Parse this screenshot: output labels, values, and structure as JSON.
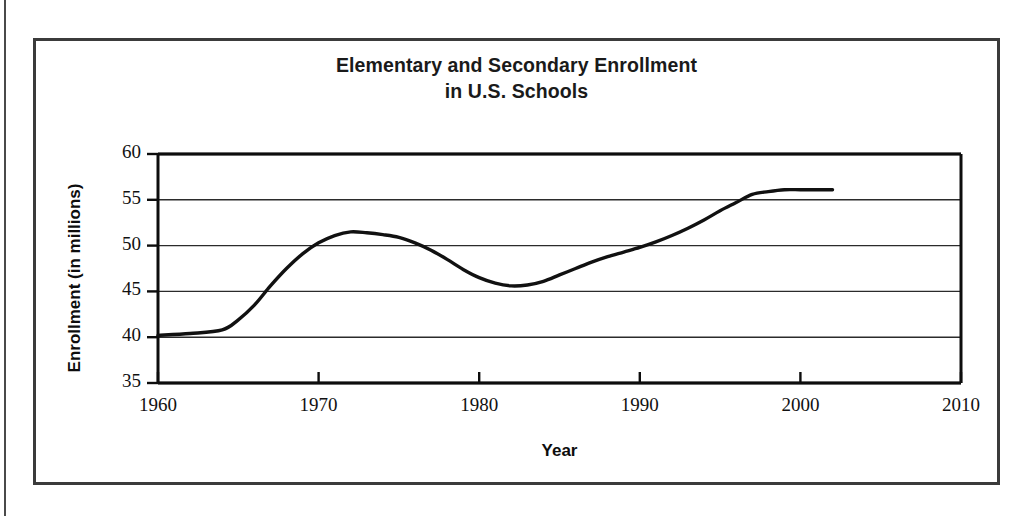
{
  "chart_data": {
    "type": "line",
    "title": "Elementary and Secondary Enrollment in U.S. Schools",
    "title_lines": [
      "Elementary and Secondary Enrollment",
      "in U.S. Schools"
    ],
    "xlabel": "Year",
    "ylabel": "Enrollment (in millions)",
    "xlim": [
      1960,
      2010
    ],
    "ylim": [
      35,
      60
    ],
    "xticks": [
      1960,
      1970,
      1980,
      1990,
      2000,
      2010
    ],
    "yticks": [
      35,
      40,
      45,
      50,
      55,
      60
    ],
    "xtick_labels": [
      "1960",
      "1970",
      "1980",
      "1990",
      "2000",
      "2010"
    ],
    "ytick_labels": [
      "35",
      "40",
      "45",
      "50",
      "55",
      "60"
    ],
    "grid": "horizontal",
    "legend": null,
    "series": [
      {
        "name": "Enrollment",
        "color": "#111111",
        "x": [
          1960,
          1962,
          1964,
          1965,
          1966,
          1967,
          1968,
          1969,
          1970,
          1971,
          1972,
          1973,
          1974,
          1975,
          1976,
          1977,
          1978,
          1979,
          1980,
          1981,
          1982,
          1983,
          1984,
          1985,
          1986,
          1987,
          1988,
          1989,
          1990,
          1991,
          1992,
          1993,
          1994,
          1995,
          1996,
          1997,
          1998,
          1999,
          2000,
          2001,
          2002
        ],
        "values": [
          40.2,
          40.4,
          40.8,
          41.9,
          43.5,
          45.6,
          47.5,
          49.1,
          50.3,
          51.1,
          51.5,
          51.4,
          51.2,
          50.9,
          50.3,
          49.5,
          48.5,
          47.4,
          46.5,
          45.9,
          45.6,
          45.7,
          46.1,
          46.8,
          47.5,
          48.2,
          48.8,
          49.3,
          49.8,
          50.4,
          51.1,
          51.9,
          52.8,
          53.8,
          54.7,
          55.6,
          55.9,
          56.1,
          56.1,
          56.1,
          56.1
        ]
      }
    ],
    "annotations": {
      "peak": {
        "x": 1972,
        "y": 51.5
      },
      "minimum": {
        "x": 1982,
        "y": 45.6
      },
      "start": {
        "x": 1960,
        "y": 40.2
      },
      "end": {
        "x": 2002,
        "y": 56.1
      }
    }
  },
  "colors": {
    "line": "#111111",
    "grid": "#2b2b2b",
    "axis": "#0d0d0d",
    "border": "#3b3b3b",
    "background": "#ffffff"
  }
}
